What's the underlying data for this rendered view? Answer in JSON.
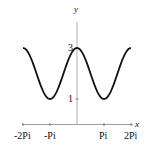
{
  "chart_data": {
    "type": "line",
    "title": "",
    "xlabel": "x",
    "ylabel": "y",
    "function": "y = 2 + cos(x)",
    "xlim": [
      -6.2832,
      6.2832
    ],
    "ylim": [
      0,
      3
    ],
    "x_ticks": [
      {
        "value": -6.2832,
        "label": "-2Pi"
      },
      {
        "value": -3.1416,
        "label": "-Pi"
      },
      {
        "value": 3.1416,
        "label": "Pi"
      },
      {
        "value": 6.2832,
        "label": "2Pi"
      }
    ],
    "y_ticks": [
      {
        "value": 1,
        "label": "1"
      },
      {
        "value": 3,
        "label": "3"
      }
    ],
    "series": [
      {
        "name": "2 + cos(x)",
        "x": [
          -6.2832,
          -4.7124,
          -3.1416,
          -1.5708,
          0,
          1.5708,
          3.1416,
          4.7124,
          6.2832
        ],
        "values": [
          3,
          2,
          1,
          2,
          3,
          2,
          1,
          2,
          3
        ]
      }
    ],
    "grid": false,
    "legend": "none",
    "color": "#111111"
  }
}
